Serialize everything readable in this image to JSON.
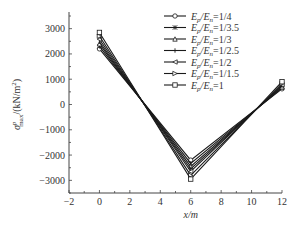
{
  "chart_data": {
    "type": "line",
    "title": "",
    "xlabel": "x/m",
    "ylabel": "σ^p_max/(kN/m²)",
    "xlim": [
      -2,
      12
    ],
    "ylim": [
      -3500,
      3500
    ],
    "xticks": [
      -2,
      0,
      2,
      4,
      6,
      8,
      10,
      12
    ],
    "yticks": [
      -3000,
      -2000,
      -1000,
      0,
      1000,
      2000,
      3000
    ],
    "grid": false,
    "legend_position": "upper right",
    "x": [
      0,
      6,
      12
    ],
    "series": [
      {
        "name": "Ep/En=1/4",
        "marker": "circle",
        "values": [
          2200,
          -2200,
          620
        ]
      },
      {
        "name": "Ep/En=1/3.5",
        "marker": "star",
        "values": [
          2300,
          -2330,
          660
        ]
      },
      {
        "name": "Ep/En=1/3",
        "marker": "triangle-up",
        "values": [
          2400,
          -2450,
          700
        ]
      },
      {
        "name": "Ep/En=1/2.5",
        "marker": "plus",
        "values": [
          2480,
          -2550,
          740
        ]
      },
      {
        "name": "Ep/En=1/2",
        "marker": "triangle-left",
        "values": [
          2580,
          -2650,
          780
        ]
      },
      {
        "name": "Ep/En=1/1.5",
        "marker": "triangle-right",
        "values": [
          2700,
          -2800,
          830
        ]
      },
      {
        "name": "Ep/En=1",
        "marker": "square",
        "values": [
          2850,
          -2950,
          900
        ]
      }
    ]
  },
  "legend": {
    "items": [
      {
        "prefix": "E",
        "sub1": "p",
        "mid": "/E",
        "sub2": "n",
        "suffix": "=1/4"
      },
      {
        "prefix": "E",
        "sub1": "p",
        "mid": "/E",
        "sub2": "n",
        "suffix": "=1/3.5"
      },
      {
        "prefix": "E",
        "sub1": "p",
        "mid": "/E",
        "sub2": "n",
        "suffix": "=1/3"
      },
      {
        "prefix": "E",
        "sub1": "p",
        "mid": "/E",
        "sub2": "n",
        "suffix": "=1/2.5"
      },
      {
        "prefix": "E",
        "sub1": "p",
        "mid": "/E",
        "sub2": "n",
        "suffix": "=1/2"
      },
      {
        "prefix": "E",
        "sub1": "p",
        "mid": "/E",
        "sub2": "n",
        "suffix": "=1/1.5"
      },
      {
        "prefix": "E",
        "sub1": "p",
        "mid": "/E",
        "sub2": "n",
        "suffix": "=1"
      }
    ]
  },
  "axes": {
    "xlabel_main": "x",
    "xlabel_unit": "/m",
    "ylabel_sigma": "σ",
    "ylabel_sup": "p",
    "ylabel_sub": "max",
    "ylabel_unit": "/(kN/m",
    "ylabel_pow": "2",
    "ylabel_close": ")"
  },
  "colors": {
    "line": "#1a1a1a",
    "axis": "#444444",
    "text": "#333333",
    "background": "#ffffff"
  }
}
